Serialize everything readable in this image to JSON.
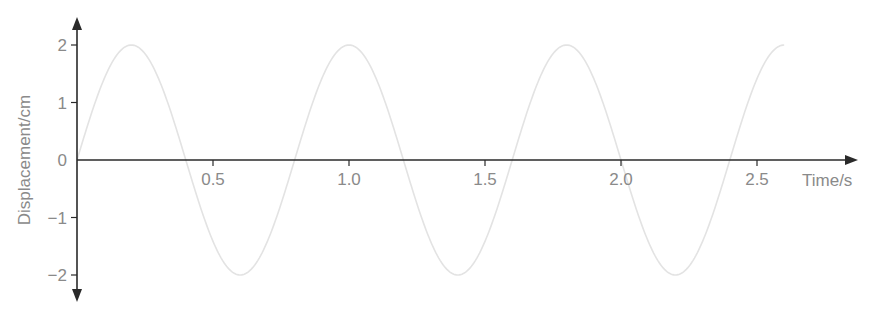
{
  "chart_data": {
    "type": "line",
    "title": "",
    "xlabel": "Time/s",
    "ylabel": "Displacement/cm",
    "xlim": [
      0,
      2.6
    ],
    "ylim": [
      -2,
      2
    ],
    "x_ticks": [
      "0.5",
      "1.0",
      "1.5",
      "2.0",
      "2.5"
    ],
    "y_ticks": [
      "2",
      "1",
      "0",
      "−1",
      "−2"
    ],
    "grid": false,
    "legend": null,
    "series": [
      {
        "name": "displacement",
        "function": "2*sin(2*pi*t/0.8)",
        "amplitude": 2,
        "period": 0.8,
        "x": [
          0,
          0.2,
          0.4,
          0.6,
          0.8,
          1.0,
          1.2,
          1.4,
          1.6,
          1.8,
          2.0,
          2.2,
          2.4,
          2.6
        ],
        "values": [
          0,
          2,
          0,
          -2,
          0,
          2,
          0,
          -2,
          0,
          2,
          0,
          -2,
          0,
          2
        ],
        "color": "#e3e3e3"
      }
    ]
  },
  "colors": {
    "axis": "#2a2a2a",
    "curve": "#e3e3e3",
    "text": "#8a8a8a"
  }
}
